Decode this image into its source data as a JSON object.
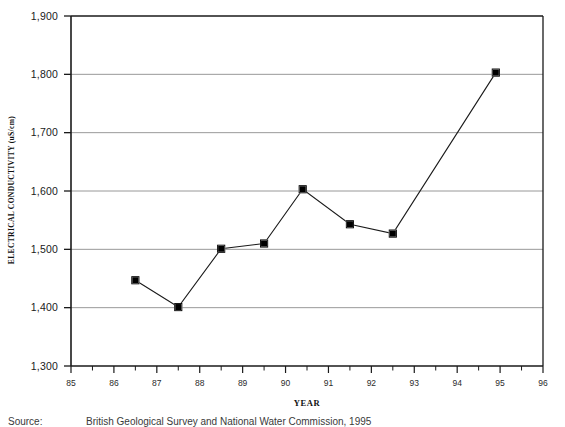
{
  "chart_data": {
    "type": "line",
    "title": "",
    "xlabel": "YEAR",
    "ylabel": "ELECTRICAL CONDUCTIVITY (uS/cm)",
    "xlim": [
      85,
      96
    ],
    "ylim": [
      1300,
      1900
    ],
    "grid": true,
    "legend": null,
    "marker": "filled-square",
    "x": [
      86.5,
      87.5,
      88.5,
      89.5,
      90.4,
      91.5,
      92.5,
      94.9
    ],
    "values": [
      1447,
      1401,
      1501,
      1510,
      1603,
      1543,
      1527,
      1803
    ],
    "points": [
      {
        "x": 86.5,
        "y": 1447
      },
      {
        "x": 87.5,
        "y": 1401
      },
      {
        "x": 88.5,
        "y": 1501
      },
      {
        "x": 89.5,
        "y": 1510
      },
      {
        "x": 90.4,
        "y": 1603
      },
      {
        "x": 91.5,
        "y": 1543
      },
      {
        "x": 92.5,
        "y": 1527
      },
      {
        "x": 94.9,
        "y": 1803
      }
    ],
    "ytick_labels": [
      "1,300",
      "1,400",
      "1,500",
      "1,600",
      "1,700",
      "1,800",
      "1,900"
    ],
    "ytick_values": [
      1300,
      1400,
      1500,
      1600,
      1700,
      1800,
      1900
    ],
    "xtick_labels": [
      "85",
      "86",
      "87",
      "88",
      "89",
      "90",
      "91",
      "92",
      "93",
      "94",
      "95",
      "96"
    ],
    "xtick_values": [
      85,
      86,
      87,
      88,
      89,
      90,
      91,
      92,
      93,
      94,
      95,
      96
    ],
    "minor_xtick_step": 0.5
  },
  "source": {
    "label": "Source:",
    "text": "British Geological Survey and National Water Commission, 1995"
  },
  "colors": {
    "line": "#1a1a1a",
    "marker": "#000000",
    "grid": "#8d8d8d",
    "axis": "#1a1a1a",
    "background": "#ffffff"
  }
}
